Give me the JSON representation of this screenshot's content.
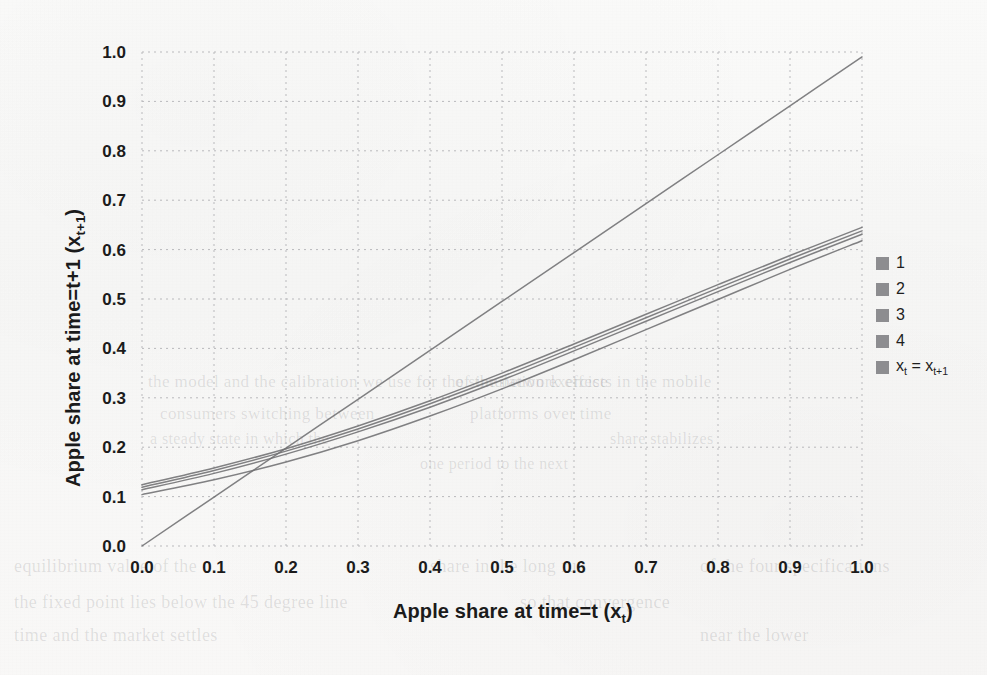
{
  "figure": {
    "background_color": "#f8f8f7",
    "ink_color": "#6f6f72",
    "text_color": "#1b1b1b"
  },
  "axes": {
    "x_title_parts": {
      "main": "Apple share at time=t (x",
      "sub": "t",
      "tail": ")"
    },
    "x_title": "Apple share at time=t (xt)",
    "y_title_parts": {
      "main": "Apple share at time=t+1 (x",
      "sub": "t+1",
      "tail": ")"
    },
    "y_title": "Apple share at time=t+1 (xt+1)",
    "x_ticks": [
      "0.0",
      "0.1",
      "0.2",
      "0.3",
      "0.4",
      "0.5",
      "0.6",
      "0.7",
      "0.8",
      "0.9",
      "1.0"
    ],
    "y_ticks": [
      "0.0",
      "0.1",
      "0.2",
      "0.3",
      "0.4",
      "0.5",
      "0.6",
      "0.7",
      "0.8",
      "0.9",
      "1.0"
    ]
  },
  "legend": {
    "position": "right",
    "swatch_color": "#8d8d90",
    "items": [
      {
        "label": "1",
        "sub": "",
        "tail": "",
        "color": "#7a7a7d"
      },
      {
        "label": "2",
        "sub": "",
        "tail": "",
        "color": "#7a7a7d"
      },
      {
        "label": "3",
        "sub": "",
        "tail": "",
        "color": "#7a7a7d"
      },
      {
        "label": "4",
        "sub": "",
        "tail": "",
        "color": "#7a7a7d"
      },
      {
        "label": "x",
        "sub": "t",
        "tail": " = x",
        "tail_sub": "t+1",
        "color": "#7a7a7d"
      }
    ]
  },
  "bleed_text": [
    {
      "text": "the model and the calibration we use for the simulation exercise",
      "x": 148,
      "y": 372,
      "size": 17
    },
    {
      "text": "of the network effects in the mobile",
      "x": 455,
      "y": 372,
      "size": 17
    },
    {
      "text": "consumers switching between",
      "x": 160,
      "y": 404,
      "size": 17
    },
    {
      "text": "platforms over time",
      "x": 470,
      "y": 404,
      "size": 17
    },
    {
      "text": "a steady state in which the",
      "x": 150,
      "y": 430,
      "size": 16
    },
    {
      "text": "share stabilizes",
      "x": 610,
      "y": 430,
      "size": 16
    },
    {
      "text": "one period to the next",
      "x": 420,
      "y": 455,
      "size": 16
    },
    {
      "text": "equilibrium value of the",
      "x": 14,
      "y": 556,
      "size": 18
    },
    {
      "text": "share in the long run",
      "x": 430,
      "y": 556,
      "size": 18
    },
    {
      "text": "of the four specifications",
      "x": 700,
      "y": 556,
      "size": 18
    },
    {
      "text": "the fixed point lies below the 45 degree line",
      "x": 14,
      "y": 592,
      "size": 18
    },
    {
      "text": "so that convergence",
      "x": 520,
      "y": 592,
      "size": 18
    },
    {
      "text": "time and the market settles",
      "x": 14,
      "y": 625,
      "size": 18
    },
    {
      "text": "near the lower",
      "x": 700,
      "y": 625,
      "size": 18
    }
  ],
  "chart_data": {
    "type": "line",
    "title": "",
    "xlabel": "Apple share at time=t (x_t)",
    "ylabel": "Apple share at time=t+1 (x_t+1)",
    "xlim": [
      0.0,
      1.0
    ],
    "ylim": [
      0.0,
      1.0
    ],
    "grid": true,
    "grid_style": "dashed",
    "legend_position": "right",
    "x": [
      0.0,
      0.1,
      0.2,
      0.3,
      0.4,
      0.5,
      0.6,
      0.7,
      0.8,
      0.9,
      1.0
    ],
    "series": [
      {
        "name": "1",
        "color": "#6f6f72",
        "values": [
          0.124,
          0.158,
          0.197,
          0.243,
          0.294,
          0.35,
          0.409,
          0.469,
          0.529,
          0.588,
          0.645
        ]
      },
      {
        "name": "2",
        "color": "#6f6f72",
        "values": [
          0.119,
          0.153,
          0.192,
          0.237,
          0.288,
          0.343,
          0.402,
          0.462,
          0.522,
          0.581,
          0.638
        ]
      },
      {
        "name": "3",
        "color": "#6f6f72",
        "values": [
          0.114,
          0.147,
          0.186,
          0.231,
          0.281,
          0.336,
          0.395,
          0.455,
          0.515,
          0.574,
          0.631
        ]
      },
      {
        "name": "4",
        "color": "#6f6f72",
        "values": [
          0.104,
          0.134,
          0.17,
          0.213,
          0.263,
          0.318,
          0.377,
          0.438,
          0.499,
          0.56,
          0.618
        ]
      },
      {
        "name": "x_t = x_t+1",
        "color": "#6f6f72",
        "values": [
          0.0,
          0.099,
          0.198,
          0.297,
          0.396,
          0.495,
          0.594,
          0.693,
          0.792,
          0.891,
          0.99
        ]
      }
    ]
  }
}
